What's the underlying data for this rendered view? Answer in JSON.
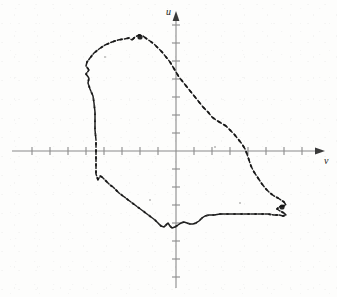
{
  "figure": {
    "title": "",
    "background_color": "#fdfdfc",
    "width": 337,
    "height": 297,
    "axis_color": "#8a8a8a",
    "curve_color": "#141414",
    "label_color": "#1b1b1b"
  },
  "axes": {
    "vertical_axis_label": "u",
    "horizontal_axis_label": "v",
    "origin_px": [
      176,
      151
    ],
    "tick_spacing_px": 18,
    "x_axis_extent_px": [
      12,
      322
    ],
    "y_axis_extent_px": [
      14,
      288
    ],
    "x_tick_count": 17,
    "y_tick_count": 14,
    "tick_half_length_px": 4,
    "arrowheads": [
      "up",
      "right"
    ],
    "gridlines": false,
    "tick_labels": []
  },
  "chart_data": {
    "type": "line",
    "title": "",
    "xlabel": "v",
    "ylabel": "u",
    "grid": false,
    "legend": null,
    "axis_units": "arbitrary (unlabeled ticks)",
    "origin_px": [
      176,
      151
    ],
    "tick_spacing_px": 18,
    "series": [
      {
        "name": "closed-orbit-trajectory",
        "style": "dashed-hand-traced",
        "closed": true,
        "points_px": [
          [
            96,
            140
          ],
          [
            95,
            130
          ],
          [
            95,
            121
          ],
          [
            95,
            112
          ],
          [
            94,
            103
          ],
          [
            93,
            96
          ],
          [
            90,
            89
          ],
          [
            88,
            83
          ],
          [
            89,
            78
          ],
          [
            86,
            74
          ],
          [
            89,
            70
          ],
          [
            86,
            66
          ],
          [
            87,
            62
          ],
          [
            90,
            58
          ],
          [
            94,
            53
          ],
          [
            99,
            49
          ],
          [
            105,
            45
          ],
          [
            112,
            42
          ],
          [
            118,
            40
          ],
          [
            124,
            39
          ],
          [
            129,
            38
          ],
          [
            132,
            40
          ],
          [
            135,
            37
          ],
          [
            139,
            35
          ],
          [
            143,
            36
          ],
          [
            147,
            39
          ],
          [
            150,
            41
          ],
          [
            154,
            44
          ],
          [
            158,
            48
          ],
          [
            162,
            52
          ],
          [
            166,
            57
          ],
          [
            170,
            62
          ],
          [
            173,
            67
          ],
          [
            176,
            72
          ],
          [
            179,
            77
          ],
          [
            183,
            82
          ],
          [
            187,
            87
          ],
          [
            191,
            92
          ],
          [
            195,
            97
          ],
          [
            199,
            102
          ],
          [
            203,
            107
          ],
          [
            208,
            112
          ],
          [
            212,
            117
          ],
          [
            216,
            120
          ],
          [
            221,
            123
          ],
          [
            226,
            126
          ],
          [
            230,
            130
          ],
          [
            234,
            134
          ],
          [
            238,
            139
          ],
          [
            242,
            144
          ],
          [
            245,
            149
          ],
          [
            247,
            154
          ],
          [
            249,
            160
          ],
          [
            251,
            166
          ],
          [
            254,
            172
          ],
          [
            258,
            178
          ],
          [
            262,
            184
          ],
          [
            266,
            189
          ],
          [
            270,
            193
          ],
          [
            274,
            196
          ],
          [
            278,
            198
          ],
          [
            281,
            200
          ],
          [
            284,
            202
          ],
          [
            286,
            205
          ],
          [
            283,
            206
          ],
          [
            279,
            207
          ],
          [
            277,
            209
          ],
          [
            280,
            211
          ],
          [
            284,
            213
          ],
          [
            286,
            215
          ],
          [
            283,
            216
          ],
          [
            279,
            215
          ],
          [
            274,
            215
          ],
          [
            268,
            214
          ],
          [
            262,
            214
          ],
          [
            256,
            214
          ],
          [
            250,
            214
          ],
          [
            244,
            214
          ],
          [
            238,
            214
          ],
          [
            232,
            214
          ],
          [
            226,
            214
          ],
          [
            220,
            214
          ],
          [
            214,
            215
          ],
          [
            209,
            215
          ],
          [
            205,
            216
          ],
          [
            202,
            218
          ],
          [
            199,
            221
          ],
          [
            196,
            223
          ],
          [
            193,
            224
          ],
          [
            190,
            224
          ],
          [
            187,
            223
          ],
          [
            184,
            222
          ],
          [
            181,
            223
          ],
          [
            178,
            225
          ],
          [
            175,
            227
          ],
          [
            172,
            228
          ],
          [
            170,
            226
          ],
          [
            168,
            223
          ],
          [
            166,
            225
          ],
          [
            164,
            227
          ],
          [
            161,
            226
          ],
          [
            158,
            223
          ],
          [
            155,
            220
          ],
          [
            151,
            217
          ],
          [
            147,
            214
          ],
          [
            143,
            211
          ],
          [
            139,
            208
          ],
          [
            135,
            205
          ],
          [
            131,
            202
          ],
          [
            127,
            199
          ],
          [
            123,
            196
          ],
          [
            119,
            193
          ],
          [
            116,
            190
          ],
          [
            113,
            187
          ],
          [
            110,
            185
          ],
          [
            108,
            183
          ],
          [
            106,
            181
          ],
          [
            104,
            179
          ],
          [
            102,
            177
          ],
          [
            100,
            176
          ],
          [
            99,
            178
          ],
          [
            98,
            180
          ],
          [
            97,
            177
          ],
          [
            96,
            174
          ],
          [
            96,
            170
          ],
          [
            96,
            166
          ],
          [
            96,
            162
          ],
          [
            96,
            158
          ],
          [
            96,
            154
          ],
          [
            96,
            150
          ],
          [
            96,
            146
          ],
          [
            96,
            142
          ]
        ]
      }
    ],
    "annotations": [
      {
        "name": "peak-marker-blob",
        "px": [
          140,
          37
        ],
        "note": "dense ink blob at upper apex"
      },
      {
        "name": "right-hook-zigzag",
        "px": [
          282,
          207
        ],
        "note": "S-shaped zigzag at lower right terminus"
      },
      {
        "name": "speckle",
        "px": [
          215,
          147
        ]
      },
      {
        "name": "speckle",
        "px": [
          150,
          200
        ]
      },
      {
        "name": "speckle",
        "px": [
          240,
          203
        ]
      },
      {
        "name": "speckle",
        "px": [
          105,
          57
        ]
      }
    ]
  }
}
